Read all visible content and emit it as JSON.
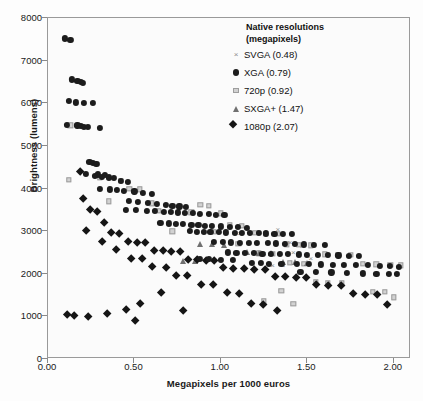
{
  "chart": {
    "type": "scatter",
    "xlabel": "Megapixels per 1000 euros",
    "ylabel": "Brightness (lumens)",
    "xlim": [
      0,
      2.1
    ],
    "ylim": [
      0,
      8000
    ],
    "xticks": [
      "0.00",
      "0.50",
      "1.00",
      "1.50",
      "2.00"
    ],
    "xtick_values": [
      0,
      0.5,
      1.0,
      1.5,
      2.0
    ],
    "yticks": [
      "0",
      "1000",
      "2000",
      "3000",
      "4000",
      "5000",
      "6000",
      "7000",
      "8000"
    ],
    "ytick_values": [
      0,
      1000,
      2000,
      3000,
      4000,
      5000,
      6000,
      7000,
      8000
    ],
    "grid": false,
    "background": "#fbfbfb"
  },
  "legend": {
    "title_line1": "Native resolutions",
    "title_line2": "(megapixels)",
    "position": "top-right",
    "entries": [
      {
        "label": "SVGA (0.48)",
        "marker": "cross",
        "color": "#8d8d8d",
        "megapixels": 0.48
      },
      {
        "label": "XGA (0.79)",
        "marker": "circle",
        "color": "#1c1c1c",
        "megapixels": 0.79
      },
      {
        "label": "720p (0.92)",
        "marker": "square",
        "color": "#d2d2d2",
        "megapixels": 0.92
      },
      {
        "label": "SXGA+ (1.47)",
        "marker": "triangle",
        "color": "#707070",
        "megapixels": 1.47
      },
      {
        "label": "1080p (2.07)",
        "marker": "diamond",
        "color": "#151515",
        "megapixels": 2.07
      }
    ]
  },
  "chart_data": {
    "type": "scatter",
    "title": "",
    "xlabel": "Megapixels per 1000 euros",
    "ylabel": "Brightness (lumens)",
    "xlim": [
      0,
      2.1
    ],
    "ylim": [
      0,
      8000
    ],
    "grid": false,
    "legend_position": "top-right",
    "series": [
      {
        "name": "SVGA (0.48)",
        "marker": "cross",
        "color": "#8d8d8d",
        "points": [
          [
            1.17,
            30
          ],
          [
            1.3,
            2200
          ],
          [
            1.36,
            2200
          ],
          [
            1.42,
            2500
          ],
          [
            1.47,
            2650
          ],
          [
            1.25,
            2480
          ],
          [
            1.52,
            2380
          ],
          [
            1.11,
            2950
          ],
          [
            1.33,
            3050
          ],
          [
            1.4,
            2750
          ]
        ]
      },
      {
        "name": "XGA (0.79)",
        "marker": "circle",
        "color": "#1c1c1c",
        "points": [
          [
            0.1,
            7520
          ],
          [
            0.13,
            7480
          ],
          [
            0.14,
            6560
          ],
          [
            0.17,
            6520
          ],
          [
            0.19,
            6500
          ],
          [
            0.2,
            6480
          ],
          [
            0.12,
            6050
          ],
          [
            0.16,
            6020
          ],
          [
            0.21,
            6000
          ],
          [
            0.26,
            6000
          ],
          [
            0.11,
            5500
          ],
          [
            0.17,
            5480
          ],
          [
            0.19,
            5460
          ],
          [
            0.21,
            5450
          ],
          [
            0.23,
            5440
          ],
          [
            0.3,
            5420
          ],
          [
            0.24,
            4620
          ],
          [
            0.26,
            4600
          ],
          [
            0.28,
            4580
          ],
          [
            0.22,
            4350
          ],
          [
            0.29,
            4330
          ],
          [
            0.33,
            4320
          ],
          [
            0.27,
            4300
          ],
          [
            0.31,
            4280
          ],
          [
            0.35,
            4260
          ],
          [
            0.38,
            4250
          ],
          [
            0.42,
            4180
          ],
          [
            0.46,
            4160
          ],
          [
            0.3,
            4000
          ],
          [
            0.36,
            3980
          ],
          [
            0.4,
            3960
          ],
          [
            0.44,
            3950
          ],
          [
            0.5,
            3930
          ],
          [
            0.55,
            3900
          ],
          [
            0.6,
            3880
          ],
          [
            0.47,
            3700
          ],
          [
            0.52,
            3680
          ],
          [
            0.58,
            3660
          ],
          [
            0.63,
            3640
          ],
          [
            0.68,
            3620
          ],
          [
            0.72,
            3600
          ],
          [
            0.76,
            3580
          ],
          [
            0.8,
            3560
          ],
          [
            0.45,
            3500
          ],
          [
            0.51,
            3490
          ],
          [
            0.57,
            3480
          ],
          [
            0.62,
            3470
          ],
          [
            0.67,
            3460
          ],
          [
            0.71,
            3450
          ],
          [
            0.75,
            3440
          ],
          [
            0.79,
            3430
          ],
          [
            0.84,
            3420
          ],
          [
            0.88,
            3410
          ],
          [
            0.93,
            3400
          ],
          [
            0.97,
            3390
          ],
          [
            1.02,
            3380
          ],
          [
            0.65,
            3200
          ],
          [
            0.7,
            3180
          ],
          [
            0.74,
            3170
          ],
          [
            0.78,
            3160
          ],
          [
            0.83,
            3150
          ],
          [
            0.87,
            3140
          ],
          [
            0.91,
            3130
          ],
          [
            0.95,
            3120
          ],
          [
            1.0,
            3110
          ],
          [
            1.05,
            3100
          ],
          [
            1.1,
            3090
          ],
          [
            1.15,
            3080
          ],
          [
            0.82,
            3000
          ],
          [
            0.86,
            2990
          ],
          [
            0.9,
            2985
          ],
          [
            0.94,
            2980
          ],
          [
            0.99,
            2975
          ],
          [
            1.03,
            2970
          ],
          [
            1.08,
            2965
          ],
          [
            1.12,
            2960
          ],
          [
            1.17,
            2955
          ],
          [
            1.22,
            2950
          ],
          [
            1.26,
            2945
          ],
          [
            1.31,
            2940
          ],
          [
            1.36,
            2935
          ],
          [
            1.41,
            2930
          ],
          [
            0.96,
            2750
          ],
          [
            1.01,
            2740
          ],
          [
            1.06,
            2735
          ],
          [
            1.11,
            2730
          ],
          [
            1.16,
            2725
          ],
          [
            1.21,
            2720
          ],
          [
            1.27,
            2715
          ],
          [
            1.32,
            2710
          ],
          [
            1.37,
            2705
          ],
          [
            1.43,
            2700
          ],
          [
            1.48,
            2690
          ],
          [
            1.54,
            2680
          ],
          [
            1.6,
            2670
          ],
          [
            1.04,
            2500
          ],
          [
            1.09,
            2490
          ],
          [
            1.14,
            2485
          ],
          [
            1.19,
            2480
          ],
          [
            1.24,
            2475
          ],
          [
            1.29,
            2470
          ],
          [
            1.34,
            2465
          ],
          [
            1.39,
            2460
          ],
          [
            1.45,
            2455
          ],
          [
            1.5,
            2450
          ],
          [
            1.56,
            2445
          ],
          [
            1.62,
            2440
          ],
          [
            1.68,
            2430
          ],
          [
            1.74,
            2420
          ],
          [
            1.8,
            2410
          ],
          [
            1.18,
            2250
          ],
          [
            1.23,
            2245
          ],
          [
            1.28,
            2240
          ],
          [
            1.35,
            2235
          ],
          [
            1.44,
            2230
          ],
          [
            1.51,
            2225
          ],
          [
            1.58,
            2220
          ],
          [
            1.65,
            2215
          ],
          [
            1.71,
            2210
          ],
          [
            1.78,
            2205
          ],
          [
            1.85,
            2200
          ],
          [
            1.92,
            2190
          ],
          [
            1.98,
            2180
          ],
          [
            2.03,
            2170
          ],
          [
            1.46,
            2050
          ],
          [
            1.55,
            2040
          ],
          [
            1.64,
            2030
          ],
          [
            1.73,
            2020
          ],
          [
            1.82,
            2010
          ],
          [
            1.9,
            2000
          ],
          [
            1.97,
            1995
          ],
          [
            2.02,
            1990
          ],
          [
            0.88,
            2350
          ],
          [
            0.93,
            2340
          ],
          [
            1.0,
            2330
          ],
          [
            1.07,
            2320
          ]
        ]
      },
      {
        "name": "720p (0.92)",
        "marker": "square",
        "color": "#d2d2d2",
        "points": [
          [
            0.13,
            5480
          ],
          [
            0.12,
            4200
          ],
          [
            0.3,
            4250
          ],
          [
            0.42,
            4180
          ],
          [
            0.47,
            4000
          ],
          [
            0.53,
            3980
          ],
          [
            0.35,
            3700
          ],
          [
            0.6,
            3650
          ],
          [
            0.88,
            3620
          ],
          [
            0.93,
            3600
          ],
          [
            0.64,
            3480
          ],
          [
            0.83,
            3440
          ],
          [
            1.0,
            3420
          ],
          [
            1.05,
            3150
          ],
          [
            1.12,
            3130
          ],
          [
            0.72,
            3000
          ],
          [
            0.96,
            2980
          ],
          [
            1.2,
            2960
          ],
          [
            1.26,
            2940
          ],
          [
            1.33,
            2930
          ],
          [
            1.1,
            2700
          ],
          [
            1.38,
            2690
          ],
          [
            1.45,
            2680
          ],
          [
            1.52,
            2670
          ],
          [
            1.22,
            2480
          ],
          [
            1.3,
            2470
          ],
          [
            1.6,
            2460
          ],
          [
            1.68,
            2450
          ],
          [
            1.75,
            2440
          ],
          [
            1.4,
            2250
          ],
          [
            1.48,
            2240
          ],
          [
            1.82,
            2230
          ],
          [
            1.9,
            2220
          ],
          [
            1.98,
            2210
          ],
          [
            2.04,
            2200
          ],
          [
            1.55,
            1800
          ],
          [
            1.62,
            1790
          ],
          [
            1.7,
            1780
          ],
          [
            1.35,
            1600
          ],
          [
            1.88,
            1580
          ],
          [
            1.95,
            1570
          ],
          [
            2.0,
            1450
          ],
          [
            1.25,
            1350
          ],
          [
            1.42,
            1300
          ]
        ]
      },
      {
        "name": "SXGA+ (1.47)",
        "marker": "triangle",
        "color": "#707070",
        "points": [
          [
            0.88,
            2700
          ],
          [
            0.95,
            2690
          ],
          [
            1.02,
            2680
          ],
          [
            1.15,
            2500
          ],
          [
            1.22,
            2490
          ],
          [
            1.29,
            2480
          ],
          [
            0.78,
            2300
          ],
          [
            0.85,
            2290
          ],
          [
            1.36,
            2280
          ],
          [
            1.43,
            2270
          ],
          [
            1.5,
            2260
          ]
        ]
      },
      {
        "name": "1080p (2.07)",
        "marker": "diamond",
        "color": "#151515",
        "points": [
          [
            0.2,
            4350
          ],
          [
            0.22,
            3700
          ],
          [
            0.26,
            3450
          ],
          [
            0.3,
            3400
          ],
          [
            0.34,
            3150
          ],
          [
            0.24,
            2950
          ],
          [
            0.38,
            2900
          ],
          [
            0.43,
            2880
          ],
          [
            0.33,
            2700
          ],
          [
            0.48,
            2690
          ],
          [
            0.53,
            2680
          ],
          [
            0.58,
            2670
          ],
          [
            0.41,
            2500
          ],
          [
            0.63,
            2490
          ],
          [
            0.68,
            2480
          ],
          [
            0.73,
            2470
          ],
          [
            0.78,
            2460
          ],
          [
            0.5,
            2300
          ],
          [
            0.56,
            2290
          ],
          [
            0.83,
            2280
          ],
          [
            0.88,
            2270
          ],
          [
            0.93,
            2260
          ],
          [
            0.98,
            2250
          ],
          [
            0.62,
            2100
          ],
          [
            0.7,
            2090
          ],
          [
            1.03,
            2080
          ],
          [
            1.09,
            2070
          ],
          [
            1.15,
            2060
          ],
          [
            1.21,
            2050
          ],
          [
            1.27,
            2040
          ],
          [
            0.76,
            1900
          ],
          [
            0.82,
            1890
          ],
          [
            1.33,
            1880
          ],
          [
            1.39,
            1870
          ],
          [
            1.45,
            1860
          ],
          [
            1.51,
            1850
          ],
          [
            0.9,
            1700
          ],
          [
            0.97,
            1690
          ],
          [
            1.57,
            1680
          ],
          [
            1.64,
            1670
          ],
          [
            1.71,
            1660
          ],
          [
            0.67,
            1500
          ],
          [
            1.05,
            1490
          ],
          [
            1.12,
            1480
          ],
          [
            1.78,
            1470
          ],
          [
            1.85,
            1460
          ],
          [
            1.92,
            1450
          ],
          [
            0.55,
            1250
          ],
          [
            1.19,
            1240
          ],
          [
            1.26,
            1230
          ],
          [
            1.98,
            1220
          ],
          [
            0.47,
            1100
          ],
          [
            0.8,
            1090
          ],
          [
            1.34,
            1080
          ],
          [
            0.13,
            980
          ],
          [
            0.17,
            960
          ],
          [
            0.25,
            930
          ],
          [
            0.36,
            1000
          ],
          [
            0.52,
            850
          ]
        ]
      }
    ]
  }
}
